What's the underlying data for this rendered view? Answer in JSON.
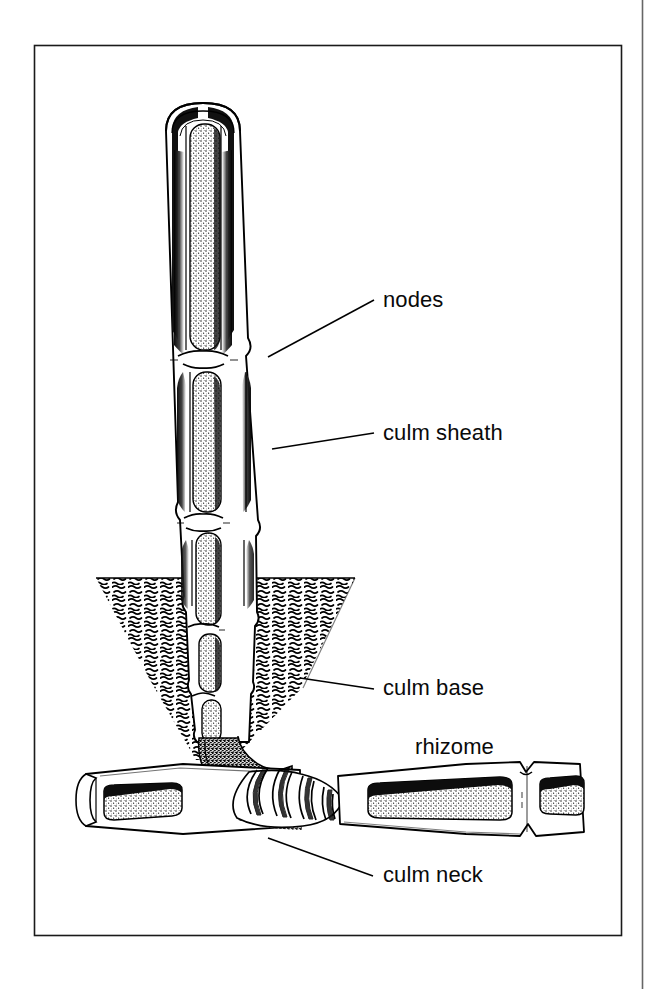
{
  "figure": {
    "kind": "botanical-line-drawing",
    "background_color": "#ffffff",
    "ink_color": "#000000",
    "border": {
      "present": true,
      "color": "#1a1a1a",
      "x": 34,
      "y": 45,
      "width": 588,
      "height": 891
    },
    "page_edge_rule": {
      "present": true,
      "color": "#555555",
      "x": 642,
      "y_top": 0,
      "y_bottom": 989
    }
  },
  "labels": [
    {
      "id": "nodes",
      "text": "nodes",
      "x": 383,
      "y": 307,
      "leader": {
        "present": true,
        "x1": 268,
        "y1": 357,
        "x2": 374,
        "y2": 300
      }
    },
    {
      "id": "culm-sheath",
      "text": "culm sheath",
      "x": 383,
      "y": 440,
      "leader": {
        "present": true,
        "x1": 272,
        "y1": 449,
        "x2": 374,
        "y2": 433
      }
    },
    {
      "id": "culm-base",
      "text": "culm base",
      "x": 383,
      "y": 695,
      "leader": {
        "present": true,
        "x1": 300,
        "y1": 678,
        "x2": 374,
        "y2": 689
      }
    },
    {
      "id": "rhizome",
      "text": "rhizome",
      "x": 415,
      "y": 754,
      "leader": {
        "present": false
      }
    },
    {
      "id": "culm-neck",
      "text": "culm neck",
      "x": 383,
      "y": 882,
      "leader": {
        "present": true,
        "x1": 268,
        "y1": 838,
        "x2": 373,
        "y2": 876
      }
    }
  ],
  "anatomy": {
    "culm": {
      "name": "culm",
      "orientation": "vertical",
      "top_y": 103,
      "bottom_y": 760,
      "cap": "rounded-dome",
      "internode_cavities": 8,
      "note": "hollow internodes shown stippled, separated by solid node diaphragms"
    },
    "soil": {
      "name": "soil",
      "pattern": "squiggle-hatch",
      "surface_y": 578,
      "left_x": 96,
      "right_x": 355,
      "shape": "v-trench"
    },
    "rhizome": {
      "name": "rhizome",
      "orientation": "horizontal",
      "y": 800,
      "left_x": 80,
      "right_x": 585,
      "cavities": 3
    },
    "culm_neck": {
      "name": "culm neck",
      "pattern": "corrugated-ribs",
      "rib_count": 9
    }
  }
}
